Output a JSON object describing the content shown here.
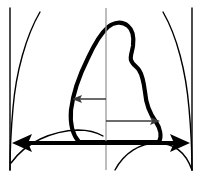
{
  "figure": {
    "name": "cardiothoracic-ratio-diagram",
    "width": 202,
    "height": 178,
    "background_color": "#ffffff"
  },
  "colors": {
    "outline": "#000000",
    "heart": "#000000",
    "midline": "#9a9a9a",
    "measure_thin": "#3a3a3a",
    "measure_thick": "#000000",
    "background": "#ffffff"
  },
  "strokes": {
    "chest_wall_width": 1.4,
    "vertical_edge_width": 1.4,
    "diaphragm_width": 1.4,
    "heart_width": 4.2,
    "midline_width": 1.3,
    "measure_thin_width": 1.5,
    "measure_thick_width": 4.0
  },
  "shapes": {
    "left_chest_wall": {
      "label": "left-chest-wall",
      "path": "M 40 12 C 26 36, 16 72, 13 108 C 11 130, 10 150, 10 170"
    },
    "left_edge_line": {
      "label": "left-vertical-edge",
      "path": "M 10 8 L 10 170"
    },
    "right_chest_wall": {
      "label": "right-chest-wall",
      "path": "M 163 12 C 177 36, 186 72, 189 108 C 191 130, 192 150, 192 170"
    },
    "right_edge_line": {
      "label": "right-vertical-edge",
      "path": "M 192 8 L 192 170"
    },
    "left_diaphragm": {
      "label": "left-hemidiaphragm",
      "path": "M 11 163 C 26 142, 52 131, 78 130 C 88 130, 96 132, 103 136"
    },
    "right_diaphragm": {
      "label": "right-hemidiaphragm",
      "path": "M 115 170 C 124 153, 140 143, 157 143 C 174 143, 186 153, 192 170"
    },
    "heart_silhouette": {
      "label": "cardiac-mediastinal-silhouette",
      "path": "M 79 142 C 72 134, 70 122, 71 110 C 73 93, 80 74, 88 58 C 94 45, 100 34, 108 27 C 114 22, 122 21, 128 26 C 133 30, 134 38, 133 46 C 132 52, 130 56, 131 60 C 132 64, 136 66, 139 70 C 143 76, 144 84, 145 92 C 146 104, 150 114, 156 122 C 160 128, 162 136, 159 142 L 79 142 Z"
    },
    "midline": {
      "label": "vertical-midline",
      "path": "M 106 8 L 106 170"
    }
  },
  "measurements": [
    {
      "id": "left-cardiac-diameter",
      "label": "left-cardiac-radius-arrow",
      "direction": "left",
      "y": 99,
      "from_x": 106,
      "to_x": 72,
      "style": "thin",
      "arrowheads": "single-left"
    },
    {
      "id": "right-cardiac-diameter",
      "label": "right-cardiac-radius-arrow",
      "direction": "right",
      "y": 121,
      "from_x": 106,
      "to_x": 160,
      "style": "thin",
      "arrowheads": "single-right"
    },
    {
      "id": "thoracic-diameter",
      "label": "thoracic-width-arrow",
      "direction": "both",
      "y": 143,
      "from_x": 12,
      "to_x": 190,
      "style": "thick",
      "arrowheads": "double"
    }
  ],
  "arrowheads": {
    "thin_left": "M 72 99 L 82 95 L 80 99 L 82 103 Z",
    "thin_right": "M 160 121 L 150 117 L 152 121 L 150 125 Z",
    "thick_left": "M 12 143 L 32 134 L 28 143 L 32 152 Z",
    "thick_right": "M 190 143 L 170 134 L 174 143 L 170 152 Z"
  }
}
